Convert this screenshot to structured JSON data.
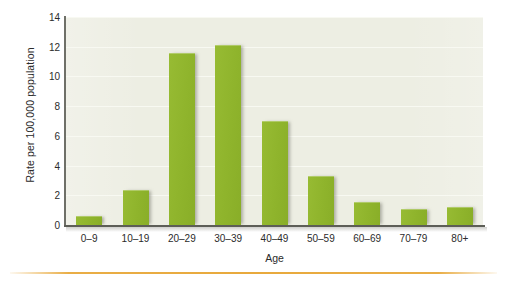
{
  "chart_data": {
    "type": "bar",
    "title": "",
    "subtitle": "",
    "xlabel": "Age",
    "ylabel": "Rate per 100,000 population",
    "categories": [
      "0–9",
      "10–19",
      "20–29",
      "30–39",
      "40–49",
      "50–59",
      "60–69",
      "70–79",
      "80+"
    ],
    "values": [
      0.6,
      2.35,
      11.6,
      12.1,
      7.0,
      3.3,
      1.55,
      1.05,
      1.2
    ],
    "ylim": [
      0,
      14
    ],
    "yticks": [
      0,
      2,
      4,
      6,
      8,
      10,
      12,
      14
    ],
    "ytick_labels": [
      "0",
      "2",
      "4",
      "6",
      "8",
      "10",
      "12",
      "14"
    ],
    "grid": true,
    "legend": false,
    "legend_position": "none",
    "series": [
      {
        "name": "Rate per 100,000 population",
        "values": [
          0.6,
          2.35,
          11.6,
          12.1,
          7.0,
          3.3,
          1.55,
          1.05,
          1.2
        ]
      }
    ],
    "annotations": []
  },
  "colors": {
    "bar": "#93b830",
    "bar_shadow": "#8c8c84",
    "plot_background": "#edeee3",
    "gridline": "#f8f9f2",
    "axis": "#5d5e57",
    "text": "#2b2b2b",
    "page_background": "#ffffff",
    "bottom_rule": "#e8a93c"
  }
}
